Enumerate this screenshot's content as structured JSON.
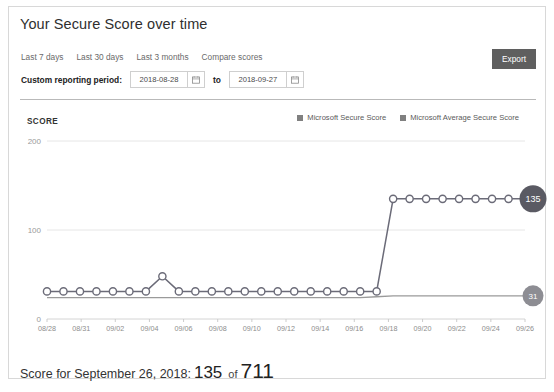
{
  "card": {
    "title": "Your Secure Score over time"
  },
  "tabs": [
    {
      "label": "Last 7 days"
    },
    {
      "label": "Last 30 days"
    },
    {
      "label": "Last 3 months"
    },
    {
      "label": "Compare scores"
    }
  ],
  "export": {
    "label": "Export"
  },
  "reporting_period": {
    "label": "Custom reporting period:",
    "start_value": "2018-08-28",
    "start_placeholder": "yyyy-mm-dd",
    "to_label": "to",
    "end_value": "2018-09-27",
    "end_placeholder": "yyyy-mm-dd",
    "calendar_icon": "calendar-icon"
  },
  "legend": [
    {
      "label": "Microsoft Secure Score",
      "color": "#808080"
    },
    {
      "label": "Microsoft Average Secure Score",
      "color": "#808080"
    }
  ],
  "badges": {
    "score": "135",
    "average": "31"
  },
  "footer": {
    "prefix": "Score for September 26, 2018:",
    "score": "135",
    "of": "of",
    "total": "711"
  },
  "chart_data": {
    "type": "line",
    "title": "Your Secure Score over time",
    "xlabel": "",
    "ylabel": "SCORE",
    "ylim": [
      0,
      200
    ],
    "yticks": [
      0,
      100,
      200
    ],
    "ytick_labels": [
      "0",
      "100",
      "200"
    ],
    "grid": true,
    "legend_position": "top-right",
    "x": [
      "08/28",
      "08/29",
      "08/30",
      "08/31",
      "09/01",
      "09/02",
      "09/03",
      "09/04",
      "09/05",
      "09/06",
      "09/07",
      "09/08",
      "09/09",
      "09/10",
      "09/11",
      "09/12",
      "09/13",
      "09/14",
      "09/15",
      "09/16",
      "09/17",
      "09/18",
      "09/19",
      "09/20",
      "09/21",
      "09/22",
      "09/23",
      "09/24",
      "09/25",
      "09/26"
    ],
    "xtick_labels": [
      "08/28",
      "08/31",
      "09/02",
      "09/04",
      "09/06",
      "09/08",
      "09/10",
      "09/12",
      "09/14",
      "09/16",
      "09/18",
      "09/20",
      "09/22",
      "09/24",
      "09/26"
    ],
    "series": [
      {
        "name": "Microsoft Secure Score",
        "color": "#6b6b78",
        "marker": "circle",
        "values": [
          31,
          31,
          31,
          31,
          31,
          31,
          31,
          48,
          31,
          31,
          31,
          31,
          31,
          31,
          31,
          31,
          31,
          31,
          31,
          31,
          31,
          135,
          135,
          135,
          135,
          135,
          135,
          135,
          135,
          135
        ]
      },
      {
        "name": "Microsoft Average Secure Score",
        "color": "#9a9a9a",
        "marker": "none",
        "values": [
          24,
          24,
          24,
          24,
          24,
          24,
          24,
          24,
          24,
          24,
          24,
          24,
          24,
          24,
          24,
          24,
          24,
          24,
          24,
          24,
          25,
          26,
          26,
          26,
          26,
          26,
          26,
          26,
          26,
          26
        ]
      }
    ],
    "annotations": [
      {
        "label": "135",
        "series": "Microsoft Secure Score",
        "position": "end"
      },
      {
        "label": "31",
        "series": "Microsoft Average Secure Score",
        "position": "end"
      }
    ]
  }
}
